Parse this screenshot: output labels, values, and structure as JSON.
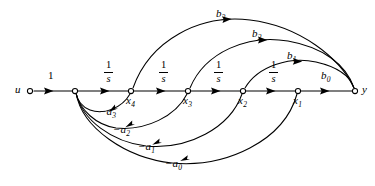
{
  "diagram": {
    "type": "signal-flow-graph",
    "background_color": "#ffffff",
    "stroke_color": "#000000",
    "nodes": [
      {
        "id": "u",
        "label": "u",
        "subscript": "",
        "x": 30,
        "y": 91,
        "label_x": 16,
        "label_y": 84
      },
      {
        "id": "junction",
        "label": "",
        "subscript": "",
        "x": 75,
        "y": 91,
        "label_x": 70,
        "label_y": 98
      },
      {
        "id": "x4",
        "label": "x",
        "subscript": "4",
        "x": 131,
        "y": 91,
        "label_x": 127,
        "label_y": 95
      },
      {
        "id": "x3",
        "label": "x",
        "subscript": "3",
        "x": 188,
        "y": 91,
        "label_x": 184,
        "label_y": 95
      },
      {
        "id": "x2",
        "label": "x",
        "subscript": "2",
        "x": 243,
        "y": 91,
        "label_x": 239,
        "label_y": 95
      },
      {
        "id": "x1",
        "label": "x",
        "subscript": "1",
        "x": 298,
        "y": 91,
        "label_x": 294,
        "label_y": 95
      },
      {
        "id": "y",
        "label": "y",
        "subscript": "",
        "x": 355,
        "y": 91,
        "label_x": 362,
        "label_y": 84
      }
    ],
    "forward_gains": [
      {
        "id": "input-gain",
        "label": "1",
        "x": 45,
        "y": 76
      },
      {
        "id": "integrator-1",
        "label": "1/s",
        "x": 102,
        "y": 63
      },
      {
        "id": "integrator-2",
        "label": "1/s",
        "x": 157,
        "y": 63
      },
      {
        "id": "integrator-3",
        "label": "1/s",
        "x": 212,
        "y": 63
      },
      {
        "id": "integrator-4",
        "label": "1/s",
        "x": 268,
        "y": 63
      },
      {
        "id": "output-gain",
        "label": "b",
        "subscript": "0",
        "x": 322,
        "y": 76
      }
    ],
    "feedforward_gains": [
      {
        "id": "b3",
        "label": "b",
        "subscript": "3",
        "x": 216,
        "y": 10,
        "from": "x4",
        "to": "y"
      },
      {
        "id": "b2",
        "label": "b",
        "subscript": "2",
        "x": 252,
        "y": 30,
        "from": "x3",
        "to": "y"
      },
      {
        "id": "b1",
        "label": "b",
        "subscript": "1",
        "x": 287,
        "y": 52,
        "from": "x2",
        "to": "y"
      }
    ],
    "feedback_gains": [
      {
        "id": "-a3",
        "label": "−a",
        "subscript": "3",
        "x": 100,
        "y": 108,
        "from": "x4",
        "to": "junction"
      },
      {
        "id": "-a2",
        "label": "−a",
        "subscript": "2",
        "x": 114,
        "y": 126,
        "from": "x3",
        "to": "junction"
      },
      {
        "id": "-a1",
        "label": "−a",
        "subscript": "1",
        "x": 139,
        "y": 143,
        "from": "x2",
        "to": "junction"
      },
      {
        "id": "-a0",
        "label": "−a",
        "subscript": "0",
        "x": 166,
        "y": 160,
        "from": "x1",
        "to": "junction"
      }
    ]
  }
}
